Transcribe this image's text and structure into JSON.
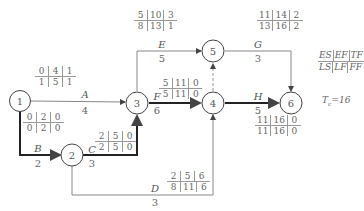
{
  "diagram": {
    "type": "activity-on-arrow network (CPM)",
    "nodes": [
      {
        "id": "1",
        "label": "1",
        "cx": 20,
        "cy": 101
      },
      {
        "id": "2",
        "label": "2",
        "cx": 72,
        "cy": 155
      },
      {
        "id": "3",
        "label": "3",
        "cx": 137,
        "cy": 103
      },
      {
        "id": "4",
        "label": "4",
        "cx": 213,
        "cy": 103
      },
      {
        "id": "5",
        "label": "5",
        "cx": 213,
        "cy": 51
      },
      {
        "id": "6",
        "label": "6",
        "cx": 291,
        "cy": 103
      }
    ],
    "activities": [
      {
        "name": "A",
        "from": "1",
        "to": "3",
        "duration": "4",
        "critical": false,
        "ES": "0",
        "EF": "4",
        "TF": "1",
        "LS": "1",
        "LF": "5",
        "FF": "1"
      },
      {
        "name": "B",
        "from": "1",
        "to": "2",
        "duration": "2",
        "critical": true,
        "ES": "0",
        "EF": "2",
        "TF": "0",
        "LS": "0",
        "LF": "2",
        "FF": "0"
      },
      {
        "name": "C",
        "from": "2",
        "to": "3",
        "duration": "3",
        "critical": true,
        "ES": "2",
        "EF": "5",
        "TF": "0",
        "LS": "2",
        "LF": "5",
        "FF": "0"
      },
      {
        "name": "D",
        "from": "2",
        "to": "4",
        "duration": "3",
        "critical": false,
        "ES": "2",
        "EF": "5",
        "TF": "6",
        "LS": "8",
        "LF": "11",
        "FF": "6"
      },
      {
        "name": "E",
        "from": "3",
        "to": "5",
        "duration": "5",
        "critical": false,
        "ES": "5",
        "EF": "10",
        "TF": "3",
        "LS": "8",
        "LF": "13",
        "FF": "1"
      },
      {
        "name": "F",
        "from": "3",
        "to": "4",
        "duration": "6",
        "critical": true,
        "ES": "5",
        "EF": "11",
        "TF": "0",
        "LS": "5",
        "LF": "11",
        "FF": "0"
      },
      {
        "name": "G",
        "from": "5",
        "to": "6",
        "duration": "3",
        "critical": false,
        "ES": "11",
        "EF": "14",
        "TF": "2",
        "LS": "13",
        "LF": "16",
        "FF": "2"
      },
      {
        "name": "H",
        "from": "4",
        "to": "6",
        "duration": "5",
        "critical": true,
        "ES": "11",
        "EF": "16",
        "TF": "0",
        "LS": "11",
        "LF": "16",
        "FF": "0"
      }
    ],
    "dummy": {
      "from": "4",
      "to": "5",
      "style": "dashed"
    },
    "legend": {
      "top": [
        "ES",
        "EF",
        "TF"
      ],
      "bottom": [
        "LS",
        "LF",
        "FF"
      ]
    },
    "computed_duration": {
      "symbol": "T",
      "subscript": "c",
      "text": "=16"
    },
    "colors": {
      "line": "#888888",
      "critical_line": "#222222",
      "text": "#555555"
    }
  }
}
